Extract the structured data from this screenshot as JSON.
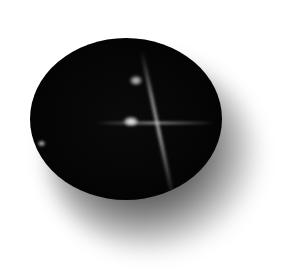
{
  "image": {
    "subject": "black star gemstone cabochon",
    "description": "Dark oval cabochon with a four-rayed star (asterism) and bright highlights, casting a soft shadow on a white background",
    "colors": {
      "background": "#ffffff",
      "gem": "#050505",
      "star": "#e6e6e6",
      "shadow": "#000000"
    }
  }
}
